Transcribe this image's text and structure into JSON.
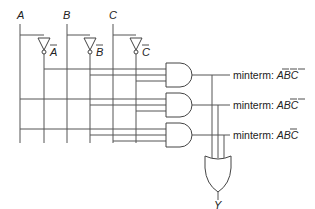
{
  "diagram": {
    "type": "logic-circuit",
    "inputs": [
      {
        "name": "A",
        "inverted_label": "A"
      },
      {
        "name": "B",
        "inverted_label": "B"
      },
      {
        "name": "C",
        "inverted_label": "C"
      }
    ],
    "minterm_prefix": "minterm:",
    "minterms": [
      {
        "vars": [
          "A",
          "B",
          "C"
        ],
        "overbar": [
          true,
          true,
          true
        ]
      },
      {
        "vars": [
          "A",
          "B",
          "C"
        ],
        "overbar": [
          false,
          true,
          true
        ]
      },
      {
        "vars": [
          "A",
          "B",
          "C"
        ],
        "overbar": [
          false,
          true,
          false
        ]
      }
    ],
    "output": "Y",
    "gates": [
      "AND",
      "AND",
      "AND",
      "OR"
    ]
  }
}
